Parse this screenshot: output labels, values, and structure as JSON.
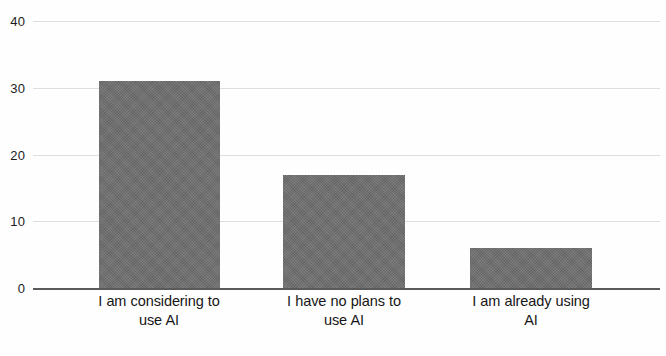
{
  "chart_data": {
    "type": "bar",
    "title": "",
    "subtitle": "",
    "xlabel": "",
    "ylabel": "",
    "categories": [
      "I am considering to use AI",
      "I have no plans to use AI",
      "I am already using AI"
    ],
    "values": [
      31,
      17,
      6
    ],
    "ylim": [
      0,
      40
    ],
    "yticks": [
      0,
      10,
      20,
      30,
      40
    ],
    "ytick_labels": [
      "0",
      "10",
      "20",
      "30",
      "40"
    ],
    "grid": true,
    "grid_axis": "y",
    "legend": null,
    "legend_position": "none",
    "annotations": [],
    "series": [
      {
        "name": "Responses",
        "values": [
          31,
          17,
          6
        ]
      }
    ],
    "colors": {
      "bar": "#6e6e6e",
      "gridline": "#dedede",
      "baseline": "#5a5a5a",
      "tick_label": "#1c1c1c",
      "category_label": "#161616",
      "background": "#ffffff"
    },
    "bars": [
      {
        "category": "I am considering to use AI",
        "value": 31,
        "label_lines": [
          "I am considering to",
          "use AI"
        ]
      },
      {
        "category": "I have no plans to use AI",
        "value": 17,
        "label_lines": [
          "I have no plans to",
          "use AI"
        ]
      },
      {
        "category": "I am already using AI",
        "value": 6,
        "label_lines": [
          "I am already using",
          "AI"
        ]
      }
    ]
  }
}
